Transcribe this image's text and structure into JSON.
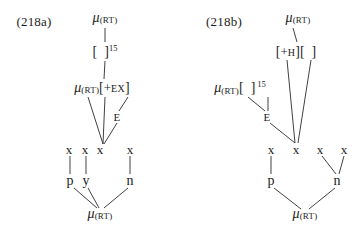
{
  "figure": {
    "caption_a": "(218a)",
    "caption_b": "(218b)",
    "type": "autosegmental-phonology-derivation"
  },
  "glyphs": {
    "mu": "μ",
    "sub_rt": "(RT)",
    "bracket_open": "[",
    "bracket_close": "]",
    "sup_15": "15",
    "feat_ex": "+EX",
    "feat_h": "+H",
    "tier_e": "E",
    "x_slot": "x"
  },
  "diagram_a": {
    "label": "(218a)",
    "nodes": [
      {
        "id": "a-mu-top",
        "name": "mu-rt-top",
        "base": "μ",
        "sub": "(RT)",
        "x": 105,
        "y": 18
      },
      {
        "id": "a-brk15",
        "name": "empty-bracket-15",
        "open": "[",
        "close": "]",
        "sup": "15",
        "x": 105,
        "y": 51
      },
      {
        "id": "a-mu-ex",
        "name": "mu-rt-plus-ex",
        "base": "μ",
        "sub": "(RT)",
        "open": "[",
        "feat": "+EX",
        "close": "]",
        "x": 102,
        "y": 88
      },
      {
        "id": "a-e",
        "name": "tier-e",
        "text": "E",
        "x": 117,
        "y": 117
      },
      {
        "id": "a-x1",
        "name": "x-slot-1",
        "text": "x",
        "x": 69,
        "y": 149
      },
      {
        "id": "a-x2",
        "name": "x-slot-2",
        "text": "x",
        "x": 85,
        "y": 149
      },
      {
        "id": "a-x3",
        "name": "x-slot-3",
        "text": "x",
        "x": 100,
        "y": 149
      },
      {
        "id": "a-x4",
        "name": "x-slot-4",
        "text": "x",
        "x": 130,
        "y": 149
      },
      {
        "id": "a-p",
        "name": "segment-p",
        "text": "p",
        "x": 70,
        "y": 181
      },
      {
        "id": "a-y",
        "name": "segment-y",
        "text": "y",
        "x": 86,
        "y": 181
      },
      {
        "id": "a-n",
        "name": "segment-n",
        "text": "n",
        "x": 130,
        "y": 181
      },
      {
        "id": "a-mu-bot",
        "name": "mu-rt-bottom",
        "base": "μ",
        "sub": "(RT)",
        "x": 100,
        "y": 214
      }
    ],
    "edges": [
      {
        "name": "edge-mu-top-to-bracket",
        "x1": 105,
        "y1": 28,
        "x2": 105,
        "y2": 42
      },
      {
        "name": "edge-bracket-to-mu-ex",
        "x1": 105,
        "y1": 61,
        "x2": 104,
        "y2": 79
      },
      {
        "name": "edge-mu-ex-to-x1",
        "x1": 88,
        "y1": 97,
        "x2": 103,
        "y2": 144
      },
      {
        "name": "edge-bracket-assoc-to-x3",
        "x1": 105,
        "y1": 97,
        "x2": 103,
        "y2": 144
      },
      {
        "name": "edge-ex-to-e",
        "x1": 128,
        "y1": 97,
        "x2": 119,
        "y2": 111
      },
      {
        "name": "edge-e-to-x3",
        "x1": 117,
        "y1": 123,
        "x2": 104,
        "y2": 144
      },
      {
        "name": "edge-x1-to-p",
        "x1": 70,
        "y1": 156,
        "x2": 70,
        "y2": 174
      },
      {
        "name": "edge-x2-to-y",
        "x1": 86,
        "y1": 156,
        "x2": 86,
        "y2": 174
      },
      {
        "name": "edge-x4-to-n",
        "x1": 130,
        "y1": 156,
        "x2": 130,
        "y2": 174
      },
      {
        "name": "edge-p-to-mu-bottom",
        "x1": 74,
        "y1": 188,
        "x2": 97,
        "y2": 208
      },
      {
        "name": "edge-y-to-mu-bottom",
        "x1": 88,
        "y1": 188,
        "x2": 99,
        "y2": 208
      },
      {
        "name": "edge-n-to-mu-bottom",
        "x1": 128,
        "y1": 188,
        "x2": 104,
        "y2": 208
      }
    ]
  },
  "diagram_b": {
    "label": "(218b)",
    "nodes": [
      {
        "id": "b-mu-top",
        "name": "mu-rt-top",
        "base": "μ",
        "sub": "(RT)",
        "x": 298,
        "y": 18
      },
      {
        "id": "b-brk-h",
        "name": "plus-h-bracket-empty",
        "text": "[+H][ ]",
        "x": 296,
        "y": 51
      },
      {
        "id": "b-mu-15",
        "name": "mu-rt-empty-bracket-15",
        "base": "μ",
        "sub": "(RT)",
        "open": "[",
        "close": "]",
        "sup": "15",
        "x": 240,
        "y": 88
      },
      {
        "id": "b-e",
        "name": "tier-e",
        "text": "E",
        "x": 267,
        "y": 117
      },
      {
        "id": "b-x1",
        "name": "x-slot-1",
        "text": "x",
        "x": 271,
        "y": 149
      },
      {
        "id": "b-x2",
        "name": "x-slot-2",
        "text": "x",
        "x": 296,
        "y": 149
      },
      {
        "id": "b-x3",
        "name": "x-slot-3",
        "text": "x",
        "x": 320,
        "y": 149
      },
      {
        "id": "b-x4",
        "name": "x-slot-4",
        "text": "x",
        "x": 344,
        "y": 149
      },
      {
        "id": "b-p",
        "name": "segment-p",
        "text": "p",
        "x": 271,
        "y": 181
      },
      {
        "id": "b-n",
        "name": "segment-n",
        "text": "n",
        "x": 337,
        "y": 181
      },
      {
        "id": "b-mu-bot",
        "name": "mu-rt-bottom",
        "base": "μ",
        "sub": "(RT)",
        "x": 305,
        "y": 214
      }
    ],
    "edges": [
      {
        "name": "edge-mu-top-to-bracket",
        "x1": 293,
        "y1": 28,
        "x2": 297,
        "y2": 42
      },
      {
        "name": "edge-bracket-to-x2-left",
        "x1": 287,
        "y1": 60,
        "x2": 295,
        "y2": 143
      },
      {
        "name": "edge-bracket-to-x2-right",
        "x1": 311,
        "y1": 60,
        "x2": 298,
        "y2": 143
      },
      {
        "name": "edge-mu15-to-e",
        "x1": 248,
        "y1": 97,
        "x2": 265,
        "y2": 111
      },
      {
        "name": "edge-bracket15-to-e",
        "x1": 268,
        "y1": 97,
        "x2": 268,
        "y2": 111
      },
      {
        "name": "edge-e-to-x2",
        "x1": 270,
        "y1": 123,
        "x2": 295,
        "y2": 143
      },
      {
        "name": "edge-x1-to-p",
        "x1": 271,
        "y1": 156,
        "x2": 271,
        "y2": 174
      },
      {
        "name": "edge-x3-to-n",
        "x1": 322,
        "y1": 156,
        "x2": 336,
        "y2": 174
      },
      {
        "name": "edge-x4-to-n",
        "x1": 344,
        "y1": 156,
        "x2": 339,
        "y2": 174
      },
      {
        "name": "edge-p-to-mu-bottom",
        "x1": 274,
        "y1": 188,
        "x2": 301,
        "y2": 209
      },
      {
        "name": "edge-n-to-mu-bottom",
        "x1": 335,
        "y1": 188,
        "x2": 309,
        "y2": 209
      }
    ]
  }
}
